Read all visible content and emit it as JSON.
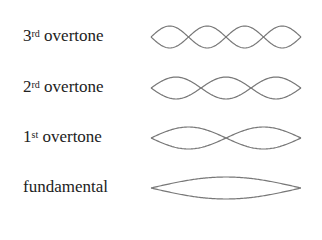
{
  "diagram": {
    "title": "",
    "rows": [
      {
        "number": "3",
        "suffix": "rd",
        "text": " overtone",
        "loops": 4
      },
      {
        "number": "2",
        "suffix": "rd",
        "text": " overtone",
        "loops": 3
      },
      {
        "number": "1",
        "suffix": "st",
        "text": " overtone",
        "loops": 2
      },
      {
        "number": "",
        "suffix": "",
        "text": "fundamental",
        "loops": 1
      }
    ],
    "colors": {
      "line": "#777777",
      "text": "#222222",
      "background": "#ffffff"
    }
  }
}
